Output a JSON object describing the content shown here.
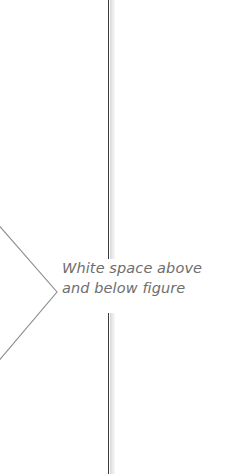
{
  "figure": {
    "background_color": "#ffffff",
    "width": 229,
    "height": 474
  },
  "annotation": {
    "text_line_1": "White space above",
    "text_line_2": "and below figure",
    "full_text": "White space above and below figure",
    "text_color": "#6e6e6e",
    "style": "italic"
  },
  "page_edge_rule": {
    "name": "vertical-page-edge-line",
    "line_color": "#3a3a3a",
    "shadow_color": "#d6d6d6",
    "x_position": 108,
    "segments": [
      {
        "label": "above-caption",
        "top": 0,
        "height": 259
      },
      {
        "label": "below-caption",
        "top": 313,
        "height": 161
      }
    ]
  },
  "pointer": {
    "name": "chevron-pointer",
    "shape": "chevron-right",
    "stroke_color": "#8c8c8c",
    "apex_x": 57,
    "apex_y": 292
  }
}
